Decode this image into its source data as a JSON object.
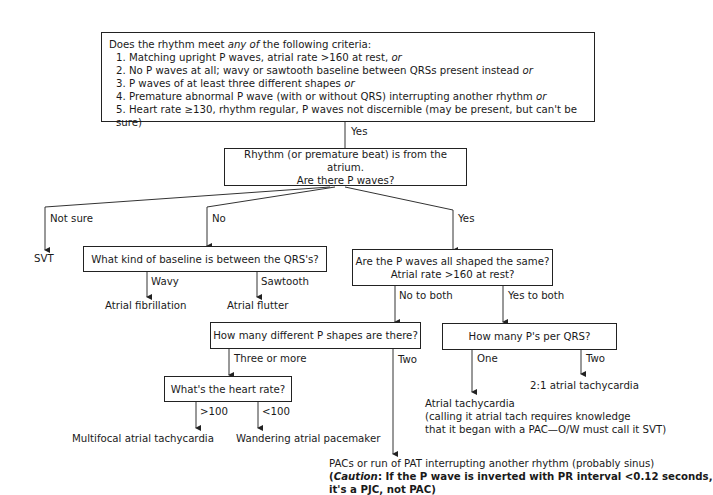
{
  "criteria_box": {
    "intro_pre": "Does the rhythm meet ",
    "intro_em": "any of",
    "intro_post": " the following criteria:",
    "items": [
      {
        "text": "1.  Matching upright P waves, atrial rate >160 at rest, ",
        "suffix": "or"
      },
      {
        "text": "2. No P waves at all; wavy or sawtooth baseline between QRSs present instead ",
        "suffix": "or"
      },
      {
        "text": "3. P waves of at least three different shapes ",
        "suffix": "or"
      },
      {
        "text": "4. Premature abnormal P wave (with or without QRS) interrupting another rhythm ",
        "suffix": "or"
      },
      {
        "text": "5. Heart rate ≥130, rhythm regular, P waves not discernible (may be present, but can't be sure)",
        "suffix": ""
      }
    ]
  },
  "edge_labels": {
    "yes_top": "Yes",
    "not_sure": "Not sure",
    "no": "No",
    "yes_right": "Yes",
    "wavy": "Wavy",
    "sawtooth": "Sawtooth",
    "no_to_both": "No to both",
    "yes_to_both": "Yes to both",
    "three_or_more": "Three or more",
    "two_shapes": "Two",
    "gt100": ">100",
    "lt100": "<100",
    "one": "One",
    "two_ps": "Two"
  },
  "nodes": {
    "atrium": {
      "line1": "Rhythm (or premature beat) is from the atrium.",
      "line2": "Are there P waves?"
    },
    "baseline": "What kind of baseline is between the QRS's?",
    "shaped_same": {
      "line1": "Are the P waves all shaped the same?",
      "line2": "Atrial rate >160 at rest?"
    },
    "p_shapes": "How many different P shapes are there?",
    "ps_per_qrs": "How many P's per QRS?",
    "heart_rate": "What's the heart rate?"
  },
  "outcomes": {
    "svt": "SVT",
    "afib": "Atrial fibrillation",
    "aflutter": "Atrial flutter",
    "mat": "Multifocal atrial tachycardia",
    "wap": "Wandering atrial pacemaker",
    "two_to_one": "2:1 atrial tachycardia",
    "atrial_tach": {
      "line1": "Atrial tachycardia",
      "line2": "(calling it atrial tach requires knowledge",
      "line3": "that it began with a PAC—O/W must call it SVT)"
    },
    "pac": {
      "line1": "PACs or run of PAT interrupting another rhythm (probably sinus)",
      "caution_open": "(",
      "caution_em": "Caution",
      "caution_rest": ": If the P wave is inverted with PR interval <0.12 seconds,",
      "line3": "it's a PJC, not PAC)"
    }
  }
}
